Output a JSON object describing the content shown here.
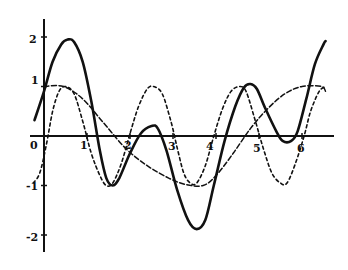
{
  "chart_data": {
    "type": "line",
    "title": "",
    "xlabel": "",
    "ylabel": "",
    "xlim": [
      -0.25,
      6.75
    ],
    "ylim": [
      -2.3,
      2.4
    ],
    "grid": false,
    "legend": null,
    "x_ticks": [
      "0",
      "1",
      "2",
      "3",
      "4",
      "5",
      "6"
    ],
    "y_ticks": [
      "2",
      "1",
      "-1",
      "-2"
    ],
    "series": [
      {
        "name": "solid",
        "style": "solid",
        "points": [
          [
            -0.22,
            0.32
          ],
          [
            0,
            0.9
          ],
          [
            0.2,
            1.5
          ],
          [
            0.4,
            1.85
          ],
          [
            0.55,
            1.95
          ],
          [
            0.7,
            1.9
          ],
          [
            0.9,
            1.5
          ],
          [
            1.1,
            0.7
          ],
          [
            1.3,
            -0.3
          ],
          [
            1.45,
            -0.85
          ],
          [
            1.6,
            -1.0
          ],
          [
            1.75,
            -0.85
          ],
          [
            2.0,
            -0.35
          ],
          [
            2.25,
            0.05
          ],
          [
            2.5,
            0.2
          ],
          [
            2.65,
            0.15
          ],
          [
            2.85,
            -0.3
          ],
          [
            3.1,
            -1.1
          ],
          [
            3.35,
            -1.7
          ],
          [
            3.55,
            -1.88
          ],
          [
            3.75,
            -1.7
          ],
          [
            3.95,
            -1.0
          ],
          [
            4.2,
            -0.1
          ],
          [
            4.45,
            0.6
          ],
          [
            4.65,
            0.98
          ],
          [
            4.8,
            1.05
          ],
          [
            4.95,
            0.95
          ],
          [
            5.15,
            0.55
          ],
          [
            5.4,
            0.1
          ],
          [
            5.55,
            -0.1
          ],
          [
            5.75,
            -0.1
          ],
          [
            5.9,
            0.1
          ],
          [
            6.1,
            0.75
          ],
          [
            6.3,
            1.45
          ],
          [
            6.5,
            1.85
          ],
          [
            6.55,
            1.92
          ]
        ]
      },
      {
        "name": "short-dashed",
        "style": "dashed",
        "points": [
          [
            -0.25,
            -0.95
          ],
          [
            -0.1,
            -0.75
          ],
          [
            0.05,
            -0.2
          ],
          [
            0.2,
            0.5
          ],
          [
            0.35,
            0.9
          ],
          [
            0.5,
            1.0
          ],
          [
            0.7,
            0.85
          ],
          [
            0.9,
            0.3
          ],
          [
            1.1,
            -0.35
          ],
          [
            1.3,
            -0.8
          ],
          [
            1.45,
            -1.0
          ],
          [
            1.6,
            -0.95
          ],
          [
            1.8,
            -0.55
          ],
          [
            2.0,
            0.05
          ],
          [
            2.2,
            0.6
          ],
          [
            2.4,
            0.95
          ],
          [
            2.55,
            1.0
          ],
          [
            2.75,
            0.85
          ],
          [
            2.95,
            0.3
          ],
          [
            3.1,
            -0.25
          ],
          [
            3.25,
            -0.75
          ],
          [
            3.4,
            -0.95
          ],
          [
            3.55,
            -0.95
          ],
          [
            3.75,
            -0.6
          ],
          [
            3.95,
            0.0
          ],
          [
            4.15,
            0.55
          ],
          [
            4.35,
            0.9
          ],
          [
            4.55,
            1.0
          ],
          [
            4.7,
            0.9
          ],
          [
            4.9,
            0.35
          ],
          [
            5.1,
            -0.25
          ],
          [
            5.3,
            -0.75
          ],
          [
            5.5,
            -0.95
          ],
          [
            5.65,
            -0.95
          ],
          [
            5.85,
            -0.55
          ],
          [
            6.05,
            0.0
          ],
          [
            6.2,
            0.5
          ],
          [
            6.4,
            0.9
          ],
          [
            6.55,
            1.0
          ]
        ]
      },
      {
        "name": "long-dashed",
        "style": "longdash",
        "points": [
          [
            0,
            1.0
          ],
          [
            0.45,
            1.0
          ],
          [
            0.9,
            0.75
          ],
          [
            1.4,
            0.25
          ],
          [
            1.9,
            -0.25
          ],
          [
            2.4,
            -0.6
          ],
          [
            2.9,
            -0.85
          ],
          [
            3.3,
            -0.98
          ],
          [
            3.7,
            -1.0
          ],
          [
            4.0,
            -0.8
          ],
          [
            4.4,
            -0.35
          ],
          [
            4.8,
            0.15
          ],
          [
            5.2,
            0.55
          ],
          [
            5.6,
            0.85
          ],
          [
            6.0,
            1.0
          ],
          [
            6.45,
            1.0
          ],
          [
            6.55,
            0.9
          ]
        ]
      }
    ]
  }
}
